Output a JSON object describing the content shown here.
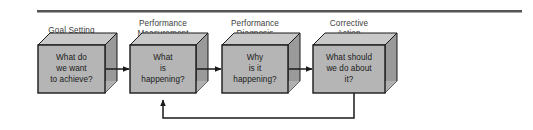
{
  "figure": {
    "type": "process-flow-diagram",
    "width": 533,
    "height": 130,
    "background": "#ffffff",
    "rule": {
      "name": "top-divider-rule",
      "color": "#555555",
      "x1": 37,
      "x2": 522,
      "y": 11,
      "thickness": 2.4
    },
    "colors": {
      "box_front": "#b5b5b5",
      "box_top": "#c9c9c9",
      "box_side": "#9a9a9a",
      "box_outline": "#1a1a1a",
      "label_text": "#3d3d3d",
      "box_text": "#1a1a1a",
      "arrow": "#1a1a1a"
    }
  },
  "stages": [
    {
      "id": "goal-setting",
      "label": "Goal Setting",
      "label_lines": [
        "Goal Setting"
      ],
      "question_lines": [
        "What do",
        "we want",
        "to achieve?"
      ],
      "front": {
        "x": 38,
        "y": 45,
        "w": 67,
        "h": 48
      },
      "depth": 12
    },
    {
      "id": "performance-measurement",
      "label": "Performance Measurement",
      "label_lines": [
        "Performance",
        "Measurement"
      ],
      "question_lines": [
        "What",
        "is",
        "happening?"
      ],
      "front": {
        "x": 130,
        "y": 45,
        "w": 66,
        "h": 48
      },
      "depth": 12
    },
    {
      "id": "performance-diagnosis",
      "label": "Performance Diagnosis",
      "label_lines": [
        "Performance",
        "Diagnosis"
      ],
      "question_lines": [
        "Why",
        "is it",
        "happening?"
      ],
      "front": {
        "x": 222,
        "y": 45,
        "w": 66,
        "h": 48
      },
      "depth": 12
    },
    {
      "id": "corrective-action",
      "label": "Corrective Action",
      "label_lines": [
        "Corrective",
        "Action"
      ],
      "question_lines": [
        "What should",
        "we do about",
        "it?"
      ],
      "front": {
        "x": 313,
        "y": 45,
        "w": 72,
        "h": 48
      },
      "depth": 12
    }
  ],
  "connectors": [
    {
      "id": "arrow-goal-to-measurement",
      "kind": "forward",
      "from": "goal-setting",
      "to": "performance-measurement",
      "x1": 106,
      "x2": 128,
      "y": 69
    },
    {
      "id": "arrow-measurement-to-diagnosis",
      "kind": "forward",
      "from": "performance-measurement",
      "to": "performance-diagnosis",
      "x1": 197,
      "x2": 220,
      "y": 69
    },
    {
      "id": "arrow-diagnosis-to-action",
      "kind": "forward",
      "from": "performance-diagnosis",
      "to": "corrective-action",
      "x1": 289,
      "x2": 311,
      "y": 69
    },
    {
      "id": "feedback-action-to-measurement",
      "kind": "feedback",
      "from": "corrective-action",
      "to": "performance-measurement",
      "down_x": 354,
      "down_y1": 93,
      "down_y2": 118,
      "left_x": 163,
      "up_y": 99
    }
  ]
}
